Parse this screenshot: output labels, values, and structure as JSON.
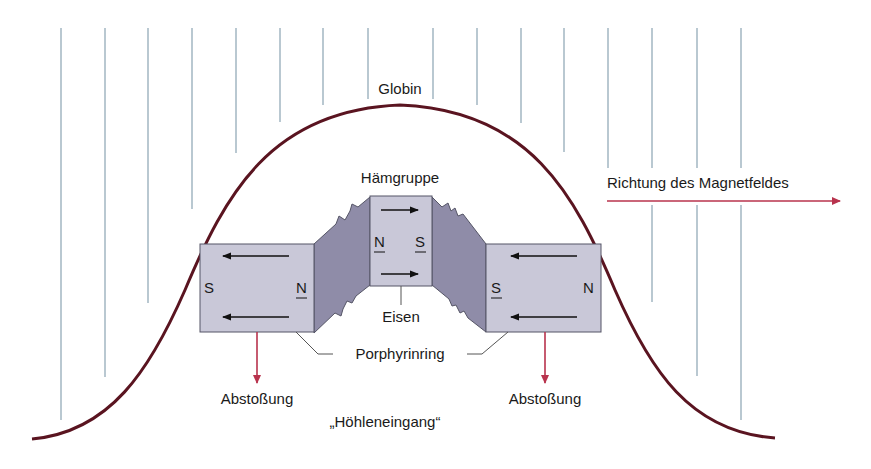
{
  "diagram": {
    "labels": {
      "globin": "Globin",
      "heme_group": "Hämgruppe",
      "field_direction": "Richtung des Magnetfeldes",
      "iron": "Eisen",
      "porphyrin_ring": "Porphyrinring",
      "repulsion_left": "Abstoßung",
      "repulsion_right": "Abstoßung",
      "cave_entrance": "„Höhleneingang“"
    },
    "magnets": {
      "left": {
        "left_pole": "S",
        "right_pole": "N",
        "right_pole_underlined": true
      },
      "center": {
        "left_pole": "N",
        "right_pole": "S",
        "underlined": true
      },
      "right": {
        "left_pole": "S",
        "right_pole": "N",
        "left_pole_underlined": true
      }
    },
    "colors": {
      "globin_curve": "#5a1420",
      "field_lines": "#8aa3b3",
      "red_arrows": "#b8334d",
      "magnet_fill": "#c9c8d8",
      "connector_fill": "#8f8ca8",
      "outline": "#555566"
    }
  }
}
